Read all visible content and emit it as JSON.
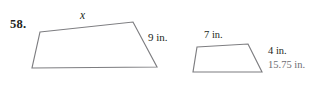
{
  "page": {
    "background_color": "#ffffff",
    "width": 326,
    "height": 95,
    "stroke_color": "#7d7d80",
    "text_color": "#231f20",
    "answer_color": "#6e6e72"
  },
  "problem": {
    "number": "58."
  },
  "figures": {
    "large_trapezoid": {
      "name": "large-trapezoid",
      "points": "40,32 133,22 157,67 32,68",
      "labels": {
        "top_side": "x",
        "right_side": "9 in."
      }
    },
    "small_trapezoid": {
      "name": "small-trapezoid",
      "points": "197,47 248,44 262,72 193,72",
      "labels": {
        "top_side": "7 in.",
        "right_side": "4 in."
      }
    }
  },
  "answer": {
    "value": "15.75 in."
  }
}
